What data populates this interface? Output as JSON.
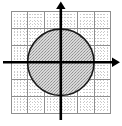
{
  "figure": {
    "title": "",
    "width": 122,
    "height": 126,
    "background_color": "#ffffff"
  },
  "chart_data": {
    "type": "scatter",
    "title": "",
    "subtitle": "",
    "xlabel": "",
    "ylabel": "",
    "xlim": [
      -3,
      3
    ],
    "ylim": [
      -3.1,
      3.1
    ],
    "xticks": [
      -3,
      -2,
      -1,
      0,
      1,
      2,
      3
    ],
    "yticks": [
      -3,
      -2,
      -1,
      0,
      1,
      2,
      3
    ],
    "xtick_labels": [
      "",
      "",
      "",
      "",
      "",
      "",
      ""
    ],
    "ytick_labels": [
      "",
      "",
      "",
      "",
      "",
      "",
      ""
    ],
    "grid": true,
    "grid_major_step": 1,
    "grid_minor_divisions": 5,
    "legend": false,
    "legend_position": "none",
    "annotations": [],
    "shapes": [
      {
        "name": "shaded-disk",
        "type": "circle",
        "center": [
          0,
          0
        ],
        "radius": 2,
        "equation": "x^2 + y^2 = 4",
        "fill": "shaded",
        "fill_color": "#b0b0b0",
        "edge_color": "#1a1a1a",
        "edge_width": 1.6
      }
    ],
    "axes": {
      "x_axis": {
        "from": [
          -3,
          0
        ],
        "to": [
          3.4,
          0
        ],
        "arrow_end": true,
        "arrow_start": false,
        "color": "#000000"
      },
      "y_axis": {
        "from": [
          0,
          -3.1
        ],
        "to": [
          0,
          3.5
        ],
        "arrow_end": true,
        "arrow_start": false,
        "color": "#000000"
      }
    },
    "colors": {
      "axis": "#000000",
      "grid_major": "#8c8c8c",
      "grid_minor": "#c9c9c9",
      "disk_fill": "#b0b0b0",
      "disk_edge": "#1a1a1a",
      "background": "#ffffff"
    }
  }
}
